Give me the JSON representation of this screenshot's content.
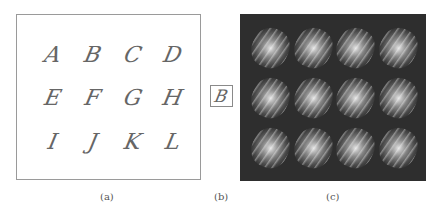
{
  "figure": {
    "panel_a": {
      "caption": "(a)",
      "glyphs": [
        "A",
        "B",
        "C",
        "D",
        "E",
        "F",
        "G",
        "H",
        "I",
        "J",
        "K",
        "L"
      ],
      "style": "calligraphic script letters on white background"
    },
    "panel_b": {
      "caption": "(b)",
      "glyph": "B"
    },
    "panel_c": {
      "caption": "(c)",
      "description": "4x3 grid of blurred bright filter patterns on dark background",
      "cells": 12,
      "background_color": "#2e2e2e"
    }
  }
}
